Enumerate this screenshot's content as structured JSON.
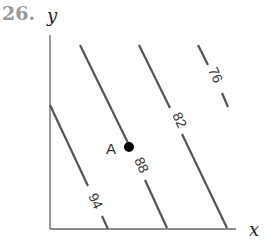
{
  "problem_number": "26.",
  "axes": {
    "x_label": "x",
    "y_label": "y"
  },
  "point": {
    "label": "A"
  },
  "contours": [
    {
      "value": "94"
    },
    {
      "value": "88"
    },
    {
      "value": "82"
    },
    {
      "value": "76"
    }
  ],
  "colors": {
    "line": "#555555",
    "axis": "#666666",
    "point": "#000000"
  }
}
